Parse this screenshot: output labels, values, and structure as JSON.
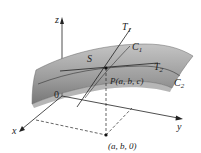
{
  "diagram": {
    "labels": {
      "z_axis": "z",
      "x_axis": "x",
      "y_axis": "y",
      "origin": "0",
      "surface": "S",
      "tangent1": "T",
      "tangent1_sub": "1",
      "tangent2": "T",
      "tangent2_sub": "2",
      "curve1": "C",
      "curve1_sub": "1",
      "curve2": "C",
      "curve2_sub": "2",
      "point": "P(a, b, c)",
      "projection": "(a, b, 0)"
    },
    "colors": {
      "surface_light": "#b5b5b5",
      "surface_dark": "#7a7a7a",
      "lines": "#222222"
    }
  }
}
